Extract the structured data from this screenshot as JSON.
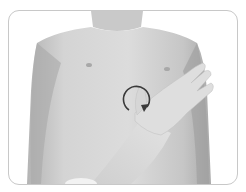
{
  "figure": {
    "gesture": "circular-rub-on-sternum",
    "arrow_direction": "clockwise",
    "colors": {
      "background": "#ffffff",
      "frame_border": "#c8c8c8",
      "skin_light": "#d9d9d9",
      "skin_mid": "#bdbdbd",
      "skin_shadow": "#8f8f8f",
      "arrow": "#3a3a3a"
    }
  }
}
